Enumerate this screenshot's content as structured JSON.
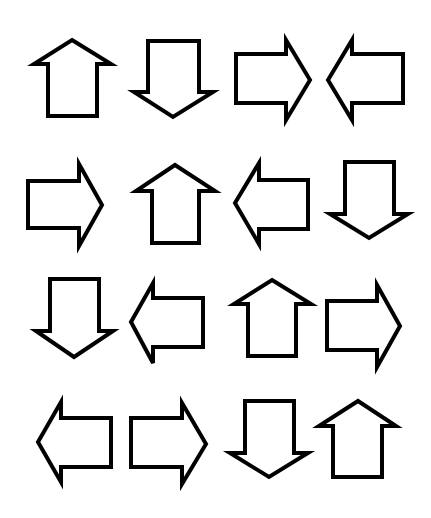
{
  "page": {
    "background": "#ffffff",
    "stroke_color": "#000000",
    "fill_color": "#ffffff"
  },
  "grid": {
    "rows": 4,
    "columns": 4,
    "rows_data": [
      [
        "up",
        "down",
        "right",
        "left"
      ],
      [
        "right",
        "up",
        "left",
        "down"
      ],
      [
        "down",
        "left",
        "up",
        "right"
      ],
      [
        "left",
        "right",
        "down",
        "up"
      ]
    ]
  },
  "arrows": [
    {
      "row": 1,
      "col": 1,
      "direction": "up",
      "icon": "arrow-up-icon"
    },
    {
      "row": 1,
      "col": 2,
      "direction": "down",
      "icon": "arrow-down-icon"
    },
    {
      "row": 1,
      "col": 3,
      "direction": "right",
      "icon": "arrow-right-icon"
    },
    {
      "row": 1,
      "col": 4,
      "direction": "left",
      "icon": "arrow-left-icon"
    },
    {
      "row": 2,
      "col": 1,
      "direction": "right",
      "icon": "arrow-right-icon"
    },
    {
      "row": 2,
      "col": 2,
      "direction": "up",
      "icon": "arrow-up-icon"
    },
    {
      "row": 2,
      "col": 3,
      "direction": "left",
      "icon": "arrow-left-icon"
    },
    {
      "row": 2,
      "col": 4,
      "direction": "down",
      "icon": "arrow-down-icon"
    },
    {
      "row": 3,
      "col": 1,
      "direction": "down",
      "icon": "arrow-down-icon"
    },
    {
      "row": 3,
      "col": 2,
      "direction": "left",
      "icon": "arrow-left-icon"
    },
    {
      "row": 3,
      "col": 3,
      "direction": "up",
      "icon": "arrow-up-icon"
    },
    {
      "row": 3,
      "col": 4,
      "direction": "right",
      "icon": "arrow-right-icon"
    },
    {
      "row": 4,
      "col": 1,
      "direction": "left",
      "icon": "arrow-left-icon"
    },
    {
      "row": 4,
      "col": 2,
      "direction": "right",
      "icon": "arrow-right-icon"
    },
    {
      "row": 4,
      "col": 3,
      "direction": "down",
      "icon": "arrow-down-icon"
    },
    {
      "row": 4,
      "col": 4,
      "direction": "up",
      "icon": "arrow-up-icon"
    }
  ]
}
